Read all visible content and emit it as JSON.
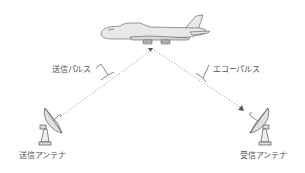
{
  "diagram": {
    "title": "",
    "labels": {
      "transmit_pulse": "送信パルス",
      "echo_pulse": "エコーパルス",
      "transmit_antenna": "送信アンテナ",
      "receive_antenna": "受信アンテナ"
    },
    "nodes": [
      {
        "id": "aircraft",
        "icon": "airplane-icon"
      },
      {
        "id": "transmit_antenna",
        "icon": "satellite-dish-icon",
        "label_key": "transmit_antenna"
      },
      {
        "id": "receive_antenna",
        "icon": "satellite-dish-icon",
        "label_key": "receive_antenna"
      }
    ],
    "edges": [
      {
        "from": "transmit_antenna",
        "to": "aircraft",
        "style": "dotted",
        "label_key": "transmit_pulse"
      },
      {
        "from": "aircraft",
        "to": "receive_antenna",
        "style": "dotted",
        "arrow": true,
        "label_key": "echo_pulse"
      }
    ],
    "colors": {
      "line": "#999999",
      "fill": "#e6e6e6",
      "stroke": "#555555",
      "text": "#555555"
    }
  }
}
